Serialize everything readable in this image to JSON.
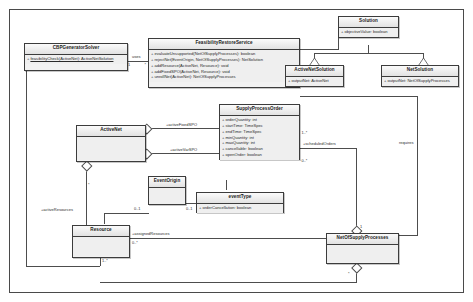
{
  "diagram": {
    "frame_label": ""
  },
  "classes": [
    {
      "id": "cbp-generator-solver",
      "name": "CBPGeneratorSolver",
      "compartments": [
        {
          "features": [
            {
              "visibility": "+",
              "signature": "feasibilityCheck(ActiveNet): ActiveNetSolution",
              "static": true
            }
          ]
        }
      ]
    },
    {
      "id": "feasibility-restore-service",
      "name": "FeasibilityRestoreService",
      "compartments": [
        {
          "features": [
            {
              "visibility": "+",
              "signature": "evaluateUnsupported(NetOfSupplyProcesses): boolean",
              "static": false
            },
            {
              "visibility": "+",
              "signature": "rejectNet(EventOrigin, NetOfSupplyProcesses): NetSolution",
              "static": false
            },
            {
              "visibility": "+",
              "signature": "addResource(ActiveNet, Resource): void",
              "static": false
            },
            {
              "visibility": "+",
              "signature": "addFixedSPO(ActiveNet, Resource): void",
              "static": false
            },
            {
              "visibility": "+",
              "signature": "unrollNet(ActiveNet): NetOfSupplyProcesses",
              "static": false
            }
          ]
        }
      ]
    },
    {
      "id": "solution",
      "name": "Solution",
      "compartments": [
        {
          "features": [
            {
              "visibility": "+",
              "signature": "objectiveValue: boolean",
              "static": false
            }
          ]
        }
      ]
    },
    {
      "id": "active-net-solution",
      "name": "ActiveNetSolution",
      "compartments": [
        {
          "features": [
            {
              "visibility": "+",
              "signature": "outputNet: ActiveNet",
              "static": false
            }
          ]
        }
      ]
    },
    {
      "id": "net-solution",
      "name": "NetSolution",
      "compartments": [
        {
          "features": [
            {
              "visibility": "+",
              "signature": "outputNet: NetOfSupplyProcesses",
              "static": false
            }
          ]
        }
      ]
    },
    {
      "id": "supply-process-order",
      "name": "SupplyProcessOrder",
      "compartments": [
        {
          "features": [
            {
              "visibility": "+",
              "signature": "orderQuantity: int",
              "static": false
            },
            {
              "visibility": "+",
              "signature": "startTime: TimeSpec",
              "static": false
            },
            {
              "visibility": "+",
              "signature": "endTime: TimeSpec",
              "static": false
            },
            {
              "visibility": "+",
              "signature": "minQuantity: int",
              "static": false
            },
            {
              "visibility": "+",
              "signature": "maxQuantity: int",
              "static": false
            },
            {
              "visibility": "+",
              "signature": "cancellable: boolean",
              "static": false
            },
            {
              "visibility": "+",
              "signature": "openOrder: boolean",
              "static": false
            }
          ]
        }
      ]
    },
    {
      "id": "active-net",
      "name": "ActiveNet",
      "compartments": [
        {
          "features": []
        }
      ]
    },
    {
      "id": "event-origin",
      "name": "EventOrigin",
      "compartments": [
        {
          "features": []
        }
      ]
    },
    {
      "id": "event-type",
      "name": "eventType",
      "compartments": [
        {
          "features": [
            {
              "visibility": "+",
              "signature": "orderCancellation: boolean",
              "static": false
            }
          ]
        }
      ]
    },
    {
      "id": "resource",
      "name": "Resource",
      "compartments": [
        {
          "features": []
        }
      ]
    },
    {
      "id": "net-of-supply-processes",
      "name": "NetOfSupplyProcesses",
      "compartments": [
        {
          "features": []
        }
      ]
    }
  ],
  "edge_labels": {
    "uses": "uses",
    "active_fixed_spo": "+activeFixedSPO",
    "active_var_spo": "+activeVarSPO",
    "scheduled_orders": "+scheduledOrders",
    "requires": "requires",
    "active_resources": "+activeResources",
    "assigned_resources": "+assignedResources"
  },
  "multiplicities": {
    "cbp_to_frs_src": "1",
    "cbp_to_frs_tgt": "*",
    "spo_right_upper": "1..*",
    "spo_right_lower": "0..*",
    "event_origin_left": "0..1",
    "event_origin_right": "0..1",
    "resource_top": "*",
    "resource_right": "0..*",
    "resource_bottom": "1..*",
    "nosp_top": "1",
    "nosp_bottom": "*"
  }
}
